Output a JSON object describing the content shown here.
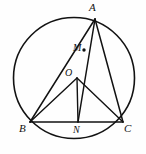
{
  "figure": {
    "kind": "geometry-diagram",
    "background_color": "#fefefe",
    "stroke_color": "#121212",
    "width": 146,
    "height": 154,
    "circle": {
      "label": "circumcircle",
      "center_x": 74,
      "center_y": 78,
      "radius": 61
    },
    "points": [
      {
        "id": "A",
        "label": "A",
        "x": 95,
        "y": 19,
        "on": "circle"
      },
      {
        "id": "B",
        "label": "B",
        "x": 30,
        "y": 122,
        "on": "circle"
      },
      {
        "id": "C",
        "label": "C",
        "x": 123,
        "y": 122,
        "on": "circle"
      },
      {
        "id": "N",
        "label": "N",
        "x": 78,
        "y": 122,
        "on": "segment-BC"
      },
      {
        "id": "M",
        "label": "M",
        "x": 83,
        "y": 50,
        "on": "segment-AB-region"
      },
      {
        "id": "O",
        "label": "O",
        "x": 77,
        "y": 78,
        "on": "center"
      }
    ],
    "segments": [
      {
        "id": "AB",
        "from": "A",
        "to": "B"
      },
      {
        "id": "AC",
        "from": "A",
        "to": "C"
      },
      {
        "id": "BC",
        "from": "B",
        "to": "C"
      },
      {
        "id": "AN",
        "from": "A",
        "to": "N"
      },
      {
        "id": "OB",
        "from": "O",
        "to": "B"
      },
      {
        "id": "OC",
        "from": "O",
        "to": "C"
      },
      {
        "id": "ON",
        "from": "O",
        "to": "N"
      }
    ]
  }
}
